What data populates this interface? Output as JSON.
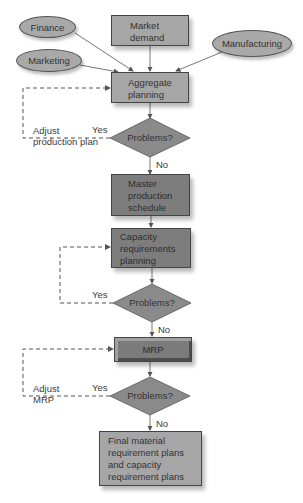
{
  "diagram": {
    "type": "flowchart",
    "inputs": {
      "finance": "Finance",
      "marketing": "Marketing",
      "market_demand": "Market demand",
      "manufacturing": "Manufacturing"
    },
    "steps": {
      "aggregate_planning": "Aggregate planning",
      "master_production_schedule": "Master production schedule",
      "capacity_requirements_planning": "Capacity requirements planning",
      "mrp": "MRP",
      "final": "Final material requirement plans and capacity requirement plans"
    },
    "lines": {
      "market_demand": [
        "Market",
        "demand"
      ],
      "aggregate_planning": [
        "Aggregate",
        "planning"
      ],
      "master_production_schedule": [
        "Master",
        "production",
        "schedule"
      ],
      "capacity_requirements_planning": [
        "Capacity",
        "requirements",
        "planning"
      ],
      "final": [
        "Final material",
        "requirement plans",
        "and capacity",
        "requirement plans"
      ]
    },
    "decisions": [
      {
        "label": "Problems?",
        "yes": "Yes",
        "no": "No",
        "feedback_label": [
          "Adjust",
          "production plan"
        ]
      },
      {
        "label": "Problems?",
        "yes": "Yes",
        "no": "No",
        "feedback_label": []
      },
      {
        "label": "Problems?",
        "yes": "Yes",
        "no": "No",
        "feedback_label": [
          "Adjust",
          "MRP"
        ]
      }
    ],
    "colors": {
      "light_fill": "#a6a6a6",
      "dark_fill": "#7d7d7d",
      "ellipse_fill": "#a9a9a9",
      "line": "#555555"
    }
  }
}
